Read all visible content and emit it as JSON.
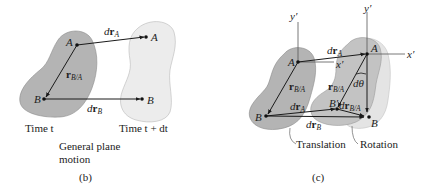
{
  "panel_b": {
    "caption": "(b)",
    "title_line1": "General plane",
    "title_line2": "motion",
    "time_left": "Time t",
    "time_right": "Time t + dt",
    "points": {
      "A": "A",
      "B": "B",
      "A2": "A",
      "B2": "B"
    },
    "vectors": {
      "drA": {
        "d": "d",
        "r": "r",
        "sub": "A"
      },
      "drB": {
        "d": "d",
        "r": "r",
        "sub": "B"
      },
      "rBA": {
        "r": "r",
        "sub": "B/A"
      }
    }
  },
  "panel_c": {
    "caption": "(c)",
    "points": {
      "A": "A",
      "B": "B",
      "A2": "A",
      "B2": "B",
      "Bprime": "B′"
    },
    "axes": {
      "y1": "y′",
      "x1": "x′",
      "y2": "y′",
      "x2": "x′"
    },
    "vectors": {
      "drA_top": {
        "d": "d",
        "r": "r",
        "sub": "A"
      },
      "drA_bottom": {
        "d": "d",
        "r": "r",
        "sub": "A"
      },
      "drB": {
        "d": "d",
        "r": "r",
        "sub": "B"
      },
      "rBA_left": {
        "r": "r",
        "sub": "B/A"
      },
      "rBA_right": {
        "r": "r",
        "sub": "B/A"
      },
      "drBA": {
        "d": "d",
        "r": "r",
        "sub": "B/A"
      }
    },
    "angle": "dθ",
    "label_translation": "Translation",
    "label_rotation": "Rotation"
  },
  "colors": {
    "body_dark": "#b4b4b4",
    "body_light": "#e6e6e6",
    "body_mid": "#c6c6c6",
    "line": "#1a1a1a",
    "outline": "#9a9a9a"
  }
}
